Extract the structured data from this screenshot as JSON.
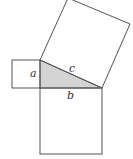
{
  "diagram": {
    "labels": {
      "a": "a",
      "b": "b",
      "c": "c"
    },
    "colors": {
      "triangle_fill": "#d4d4d4",
      "stroke": "#555555",
      "background": "#ffffff"
    }
  }
}
